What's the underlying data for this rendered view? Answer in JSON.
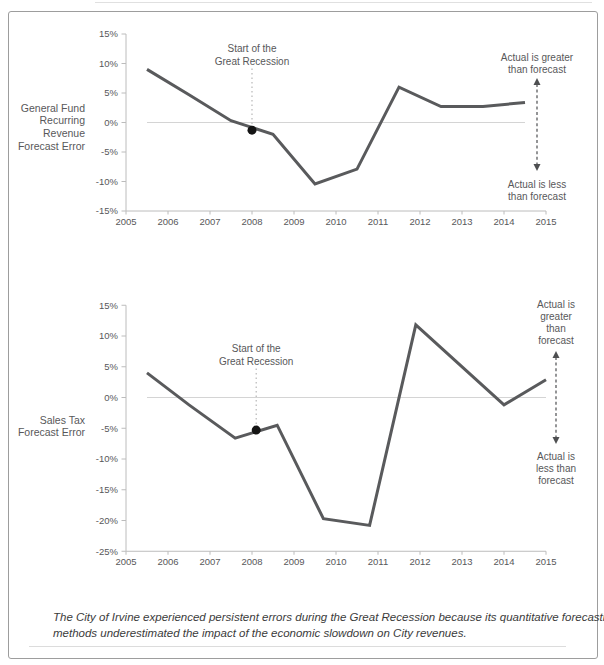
{
  "figure": {
    "caption_lines": [
      "The City of Irvine experienced persistent errors during the Great Recession because its quantitative forecasting",
      "methods underestimated the impact of the economic slowdown on City revenues."
    ]
  },
  "colors": {
    "line": "#595a5c",
    "axis": "#bcbcbc",
    "zero_line": "#d4d4d4",
    "text": "#58585a",
    "dot": "#141414",
    "dotted_guide": "#b7b7b7",
    "arrow": "#4e4f51",
    "caption_text": "#3b3b3b",
    "border": "#9d9d9d"
  },
  "chart_data": [
    {
      "type": "line",
      "title_lines": [
        "General Fund",
        "Recurring",
        "Revenue",
        "Forecast Error"
      ],
      "xlabel": "",
      "ylabel": "Forecast error (%)",
      "xlim": [
        2005,
        2015
      ],
      "ylim": [
        -15,
        15
      ],
      "x_ticks": [
        2005,
        2006,
        2007,
        2008,
        2009,
        2010,
        2011,
        2012,
        2013,
        2014,
        2015
      ],
      "y_ticks": [
        15,
        10,
        5,
        0,
        -5,
        -10,
        -15
      ],
      "grid": "zero-reference-line-only",
      "legend": "none",
      "points": [
        [
          2005.5,
          9.0
        ],
        [
          2006.5,
          4.7
        ],
        [
          2007.5,
          0.3
        ],
        [
          2008.5,
          -2.0
        ],
        [
          2009.5,
          -10.4
        ],
        [
          2010.5,
          -7.9
        ],
        [
          2011.5,
          6.0
        ],
        [
          2012.5,
          2.7
        ],
        [
          2013.5,
          2.7
        ],
        [
          2014.5,
          3.4
        ]
      ],
      "recession_marker": {
        "x": 2008.0,
        "y": -1.3,
        "label": [
          "Start of the",
          "Great Recession"
        ]
      },
      "right_note_greater": [
        "Actual is greater",
        "than forecast"
      ],
      "right_note_less": [
        "Actual is less",
        "than forecast"
      ]
    },
    {
      "type": "line",
      "title_lines": [
        "Sales Tax",
        "Forecast Error"
      ],
      "xlabel": "",
      "ylabel": "Forecast error (%)",
      "xlim": [
        2005,
        2015
      ],
      "ylim": [
        -25,
        15
      ],
      "x_ticks": [
        2005,
        2006,
        2007,
        2008,
        2009,
        2010,
        2011,
        2012,
        2013,
        2014,
        2015
      ],
      "y_ticks": [
        15,
        10,
        5,
        0,
        -5,
        -10,
        -15,
        -20,
        -25
      ],
      "grid": "zero-reference-line-only",
      "legend": "none",
      "points": [
        [
          2005.5,
          4.0
        ],
        [
          2006.5,
          -1.2
        ],
        [
          2007.6,
          -6.6
        ],
        [
          2008.6,
          -4.5
        ],
        [
          2009.7,
          -19.7
        ],
        [
          2010.8,
          -20.8
        ],
        [
          2011.9,
          11.8
        ],
        [
          2014.0,
          -1.2
        ],
        [
          2015.0,
          2.9
        ]
      ],
      "recession_marker": {
        "x": 2008.1,
        "y": -5.3,
        "label": [
          "Start of the",
          "Great Recession"
        ]
      },
      "right_note_greater": [
        "Actual is",
        "greater",
        "than",
        "forecast"
      ],
      "right_note_less": [
        "Actual is",
        "less than",
        "forecast"
      ]
    }
  ]
}
